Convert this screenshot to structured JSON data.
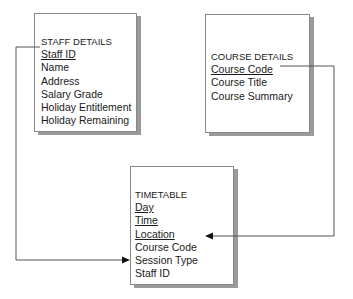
{
  "entities": {
    "staff": {
      "title": "STAFF DETAILS",
      "fields": [
        {
          "label": "Staff ID",
          "key": true
        },
        {
          "label": "Name",
          "key": false
        },
        {
          "label": "Address",
          "key": false
        },
        {
          "label": "Salary Grade",
          "key": false
        },
        {
          "label": "Holiday Entitlement",
          "key": false
        },
        {
          "label": "Holiday Remaining",
          "key": false
        }
      ]
    },
    "course": {
      "title": "COURSE DETAILS",
      "fields": [
        {
          "label": "Course Code",
          "key": true
        },
        {
          "label": "Course Title",
          "key": false
        },
        {
          "label": "Course Summary",
          "key": false
        }
      ]
    },
    "timetable": {
      "title": "TIMETABLE",
      "fields": [
        {
          "label": "Day",
          "key": true
        },
        {
          "label": "Time",
          "key": true
        },
        {
          "label": "Location",
          "key": true
        },
        {
          "label": "Course Code",
          "key": false
        },
        {
          "label": "Session Type",
          "key": false
        },
        {
          "label": "Staff ID",
          "key": false
        }
      ]
    }
  },
  "relationships": [
    {
      "from": "staff.Staff ID",
      "to": "timetable.Staff ID"
    },
    {
      "from": "course.Course Code",
      "to": "timetable.Course Code"
    }
  ],
  "colors": {
    "line": "#555555",
    "border": "#8a8a8a",
    "shadow": "#9a9a9a"
  }
}
